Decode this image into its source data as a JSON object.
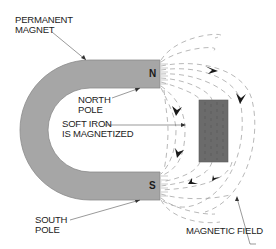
{
  "diagram": {
    "labels": {
      "permanent_magnet_line1": "PERMANENT",
      "permanent_magnet_line2": "MAGNET",
      "north_pole_line1": "NORTH",
      "north_pole_line2": "POLE",
      "soft_iron_line1": "SOFT IRON",
      "soft_iron_line2": "IS MAGNETIZED",
      "south_pole_line1": "SOUTH",
      "south_pole_line2": "POLE",
      "magnetic_field": "MAGNETIC FIELD"
    },
    "pole_marks": {
      "north": "N",
      "south": "S"
    },
    "colors": {
      "magnet_fill": "#a6a6a6",
      "magnet_stroke": "#8c8c8c",
      "soft_iron_fill": "#6b6b6b",
      "field_lines": "#9a9a9a",
      "arrows": "#1a1a1a",
      "leader_lines": "#555555",
      "text": "#222222"
    },
    "components": [
      {
        "name": "horseshoe permanent magnet",
        "poles": [
          "N",
          "S"
        ]
      },
      {
        "name": "soft iron bar",
        "state": "magnetized"
      },
      {
        "name": "magnetic field lines",
        "direction": "N to S"
      }
    ]
  }
}
